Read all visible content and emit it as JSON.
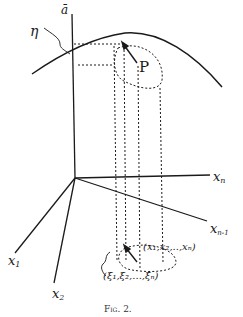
{
  "figure": {
    "caption": "Fig. 2.",
    "labels": {
      "a_bar": "ā",
      "eta": "η",
      "P": "P",
      "x_n": "x",
      "x_n_sub": "n",
      "x_n1": "x",
      "x_n1_sub": "n-1",
      "x_1": "x",
      "x_1_sub": "1",
      "x_2": "x",
      "x_2_sub": "2",
      "point_x": "(x₁,x₂,..,xₙ)",
      "point_xi": "(ξ₁,ξ₂,...,ξₙ)"
    },
    "colors": {
      "ink": "#1a1a1a",
      "background": "#ffffff"
    }
  }
}
